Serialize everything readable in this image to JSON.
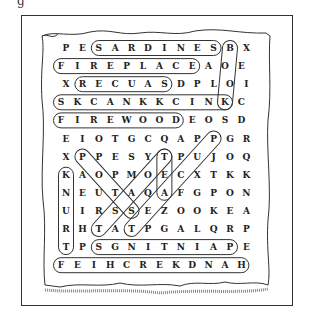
{
  "title_fragment": "g",
  "puzzle": {
    "type": "word-search",
    "rows": 13,
    "cols": 12,
    "grid": [
      [
        "P",
        "E",
        "S",
        "A",
        "R",
        "D",
        "I",
        "N",
        "E",
        "S",
        "B",
        "X"
      ],
      [
        "F",
        "I",
        "R",
        "E",
        "P",
        "L",
        "A",
        "C",
        "E",
        "A",
        "O",
        "E"
      ],
      [
        "X",
        "R",
        "E",
        "C",
        "U",
        "A",
        "S",
        "D",
        "P",
        "L",
        "O",
        "I"
      ],
      [
        "S",
        "K",
        "C",
        "A",
        "N",
        "K",
        "K",
        "C",
        "I",
        "N",
        "K",
        "C"
      ],
      [
        "F",
        "I",
        "R",
        "E",
        "W",
        "O",
        "O",
        "D",
        "E",
        "O",
        "S",
        "D"
      ],
      [
        "E",
        "I",
        "O",
        "T",
        "G",
        "C",
        "Q",
        "A",
        "P",
        "P",
        "G",
        "R"
      ],
      [
        "X",
        "P",
        "P",
        "E",
        "S",
        "Y",
        "T",
        "P",
        "U",
        "J",
        "O",
        "Q"
      ],
      [
        "K",
        "A",
        "O",
        "P",
        "M",
        "O",
        "E",
        "C",
        "X",
        "T",
        "K",
        "K"
      ],
      [
        "N",
        "E",
        "U",
        "T",
        "A",
        "Q",
        "A",
        "F",
        "G",
        "P",
        "O",
        "N"
      ],
      [
        "U",
        "I",
        "R",
        "S",
        "S",
        "E",
        "Z",
        "O",
        "O",
        "K",
        "E",
        "A"
      ],
      [
        "R",
        "H",
        "T",
        "A",
        "T",
        "P",
        "G",
        "A",
        "L",
        "Q",
        "R",
        "P"
      ],
      [
        "T",
        "P",
        "S",
        "G",
        "N",
        "I",
        "T",
        "N",
        "I",
        "A",
        "P",
        "E"
      ],
      [
        "F",
        "E",
        "I",
        "H",
        "C",
        "R",
        "E",
        "K",
        "D",
        "N",
        "A",
        "H"
      ]
    ],
    "found_words": [
      {
        "word": "SARDINES",
        "start": [
          0,
          2
        ],
        "end": [
          0,
          9
        ]
      },
      {
        "word": "BOOK",
        "start": [
          0,
          10
        ],
        "end": [
          3,
          10
        ]
      },
      {
        "word": "FIREPLACE",
        "start": [
          1,
          0
        ],
        "end": [
          1,
          8
        ]
      },
      {
        "word": "SAUCER",
        "start": [
          2,
          6
        ],
        "end": [
          2,
          1
        ]
      },
      {
        "word": "KNICKKNACKS",
        "start": [
          3,
          10
        ],
        "end": [
          3,
          0
        ]
      },
      {
        "word": "FIREWOOD",
        "start": [
          4,
          0
        ],
        "end": [
          4,
          7
        ]
      },
      {
        "word": "TEACUP",
        "start": [
          10,
          4
        ],
        "end": [
          5,
          9
        ]
      },
      {
        "word": "TOAST",
        "start": [
          6,
          6
        ],
        "end": [
          10,
          2
        ]
      },
      {
        "word": "POTS",
        "start": [
          6,
          1
        ],
        "end": [
          9,
          4
        ]
      },
      {
        "word": "TEA",
        "start": [
          6,
          6
        ],
        "end": [
          8,
          6
        ]
      },
      {
        "word": "TRUNK",
        "start": [
          11,
          0
        ],
        "end": [
          7,
          0
        ]
      },
      {
        "word": "PAINTINGS",
        "start": [
          11,
          10
        ],
        "end": [
          11,
          2
        ]
      },
      {
        "word": "HANDKERCHIEF",
        "start": [
          12,
          11
        ],
        "end": [
          12,
          0
        ]
      }
    ]
  },
  "colors": {
    "ink": "#222222",
    "paper": "#ffffff",
    "frame": "#333333"
  }
}
